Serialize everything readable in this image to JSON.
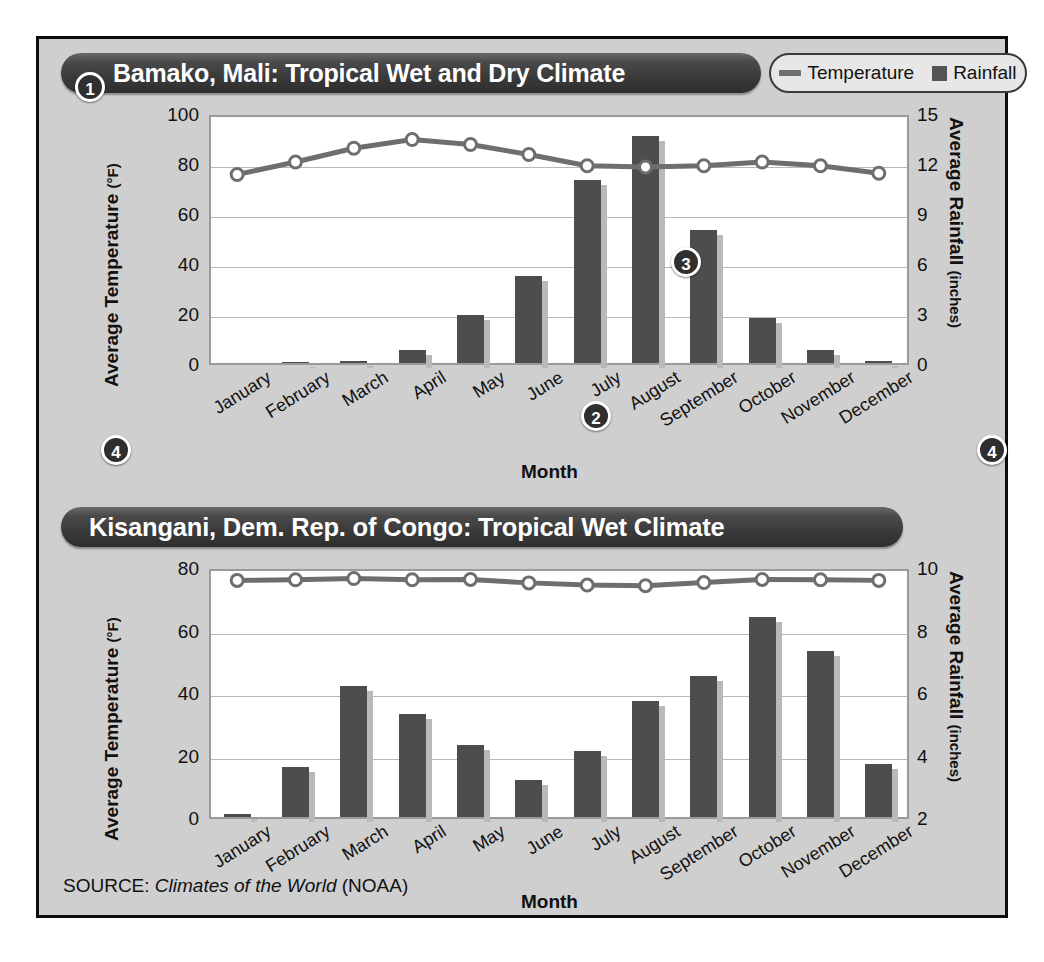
{
  "source": {
    "prefix": "SOURCE: ",
    "italic": "Climates of the World",
    "suffix": " (NOAA)"
  },
  "legend": {
    "temperature_label": "Temperature",
    "rainfall_label": "Rainfall",
    "line_color": "#6e6e6e",
    "bar_color": "#555555"
  },
  "callouts": {
    "one": "1",
    "two": "2",
    "three": "3",
    "four": "4"
  },
  "charts": [
    {
      "title": "Bamako, Mali: Tropical Wet and Dry Climate",
      "xlabel": "Month",
      "left_axis_title": "Average Temperature",
      "left_axis_unit": "(°F)",
      "right_axis_title": "Average Rainfall",
      "right_axis_unit": "(inches)",
      "left_ticks": [
        "0",
        "20",
        "40",
        "60",
        "80",
        "100"
      ],
      "right_ticks": [
        "0",
        "3",
        "6",
        "9",
        "12",
        "15"
      ]
    },
    {
      "title": "Kisangani, Dem. Rep. of Congo: Tropical Wet Climate",
      "xlabel": "Month",
      "left_axis_title": "Average Temperature",
      "left_axis_unit": "(°F)",
      "right_axis_title": "Average Rainfall",
      "right_axis_unit": "(inches)",
      "left_ticks": [
        "0",
        "20",
        "40",
        "60",
        "80"
      ],
      "right_ticks": [
        "2",
        "4",
        "6",
        "8",
        "10"
      ]
    }
  ],
  "chart_data": [
    {
      "type": "bar",
      "title": "Bamako, Mali: Tropical Wet and Dry Climate",
      "xlabel": "Month",
      "ylabel": "Average Temperature (°F)",
      "y2label": "Average Rainfall (inches)",
      "categories": [
        "January",
        "February",
        "March",
        "April",
        "May",
        "June",
        "July",
        "August",
        "September",
        "October",
        "November",
        "December"
      ],
      "ylim": [
        0,
        100
      ],
      "y2lim": [
        0,
        15
      ],
      "grid": true,
      "legend_position": "top-right",
      "series": [
        {
          "name": "Rainfall",
          "type": "bar",
          "axis": "right",
          "unit": "inches",
          "values": [
            0.0,
            0.05,
            0.1,
            0.8,
            2.9,
            5.2,
            11.0,
            13.6,
            8.0,
            2.7,
            0.8,
            0.1
          ]
        },
        {
          "name": "Temperature",
          "type": "line",
          "axis": "left",
          "unit": "°F",
          "values": [
            77,
            82,
            87.5,
            91,
            89,
            85,
            80.5,
            80,
            80.5,
            82,
            80.5,
            77.5
          ]
        }
      ]
    },
    {
      "type": "bar",
      "title": "Kisangani, Dem. Rep. of Congo: Tropical Wet Climate",
      "xlabel": "Month",
      "ylabel": "Average Temperature (°F)",
      "y2label": "Average Rainfall (inches)",
      "categories": [
        "January",
        "February",
        "March",
        "April",
        "May",
        "June",
        "July",
        "August",
        "September",
        "October",
        "November",
        "December"
      ],
      "ylim": [
        0,
        80
      ],
      "y2lim": [
        2,
        10
      ],
      "grid": true,
      "legend_position": "top-right",
      "series": [
        {
          "name": "Rainfall",
          "type": "bar",
          "axis": "right",
          "unit": "inches",
          "values": [
            2.1,
            3.6,
            6.2,
            5.3,
            4.3,
            3.2,
            4.1,
            5.7,
            6.5,
            8.4,
            7.3,
            3.7
          ]
        },
        {
          "name": "Temperature",
          "type": "line",
          "axis": "left",
          "unit": "°F",
          "values": [
            77,
            77.2,
            77.6,
            77.2,
            77.3,
            76.2,
            75.5,
            75.3,
            76.3,
            77.3,
            77.2,
            77.0
          ]
        }
      ]
    }
  ]
}
